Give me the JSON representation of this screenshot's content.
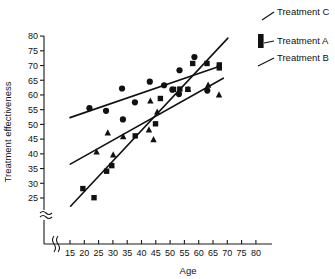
{
  "chart_data": {
    "type": "scatter",
    "title": "",
    "xlabel": "Age",
    "ylabel": "Treatment effectiveness",
    "xlim": [
      13,
      82
    ],
    "ylim": [
      21,
      80
    ],
    "xticks": [
      15,
      20,
      25,
      30,
      35,
      40,
      45,
      50,
      55,
      60,
      65,
      70,
      75,
      80
    ],
    "yticks": [
      25,
      30,
      35,
      40,
      45,
      50,
      55,
      60,
      65,
      70,
      75,
      80
    ],
    "grid": false,
    "axis_break_x": true,
    "axis_break_y": true,
    "legend_position": "right",
    "series": [
      {
        "name": "Treatment A",
        "marker": "square",
        "points": [
          [
            19.5,
            28.2
          ],
          [
            23.4,
            25.1
          ],
          [
            27.8,
            34.1
          ],
          [
            29.6,
            36.0
          ],
          [
            37.8,
            46.1
          ],
          [
            44.9,
            50.2
          ],
          [
            46.6,
            58.8
          ],
          [
            51.2,
            61.9
          ],
          [
            53.4,
            62.0
          ],
          [
            56.2,
            61.9
          ],
          [
            57.9,
            70.7
          ],
          [
            62.9,
            70.7
          ],
          [
            67.2,
            70.2
          ],
          [
            67.2,
            69.2
          ]
        ],
        "fit_line": {
          "x0": 15.2,
          "y0": 22.2,
          "x1": 70.2,
          "y1": 79.3
        }
      },
      {
        "name": "Treatment B",
        "marker": "triangle",
        "points": [
          [
            24.3,
            40.6
          ],
          [
            28.2,
            47.1
          ],
          [
            30.1,
            39.6
          ],
          [
            33.6,
            45.8
          ],
          [
            42.6,
            48.1
          ],
          [
            43.1,
            57.9
          ],
          [
            44.2,
            44.8
          ],
          [
            45.5,
            54.2
          ],
          [
            56.3,
            61.9
          ],
          [
            63.3,
            63.3
          ],
          [
            67.1,
            60.0
          ]
        ],
        "fit_line": {
          "x0": 15.1,
          "y0": 36.5,
          "x1": 68.6,
          "y1": 65.7
        }
      },
      {
        "name": "Treatment C",
        "marker": "circle",
        "points": [
          [
            21.8,
            55.5
          ],
          [
            27.6,
            54.6
          ],
          [
            33.2,
            62.2
          ],
          [
            33.5,
            51.7
          ],
          [
            37.7,
            57.5
          ],
          [
            42.9,
            64.5
          ],
          [
            47.9,
            63.3
          ],
          [
            50.8,
            61.8
          ],
          [
            53.1,
            60.3
          ],
          [
            53.3,
            68.4
          ],
          [
            58.5,
            72.9
          ],
          [
            63.0,
            61.5
          ]
        ],
        "fit_line": {
          "x0": 15.0,
          "y0": 52.3,
          "x1": 67.6,
          "y1": 69.8
        }
      }
    ]
  },
  "legend": {
    "items": [
      {
        "label": "Treatment C"
      },
      {
        "label": "Treatment A"
      },
      {
        "label": "Treatment B"
      }
    ]
  }
}
